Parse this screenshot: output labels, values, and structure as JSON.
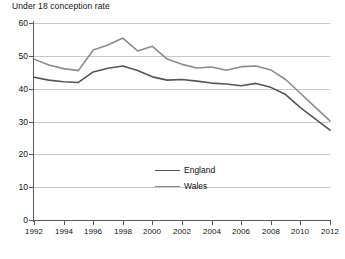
{
  "chart_data": {
    "type": "line",
    "title": "Under 18 conception rate",
    "xlabel": "",
    "ylabel": "",
    "grid": true,
    "legend_position": "inside-center",
    "xlim": [
      1992,
      2012
    ],
    "ylim": [
      0,
      60
    ],
    "yticks": [
      0,
      10,
      20,
      30,
      40,
      50,
      60
    ],
    "x": [
      1992,
      1993,
      1994,
      1995,
      1996,
      1997,
      1998,
      1999,
      2000,
      2001,
      2002,
      2003,
      2004,
      2005,
      2006,
      2007,
      2008,
      2009,
      2010,
      2011,
      2012
    ],
    "xticks": [
      1992,
      1994,
      1996,
      1998,
      2000,
      2002,
      2004,
      2006,
      2008,
      2010,
      2012
    ],
    "xtick_labels": [
      "1992",
      "1994",
      "1996",
      "1998",
      "2000",
      "2002",
      "2004",
      "2006",
      "2008",
      "2010",
      "2012"
    ],
    "ytick_labels": [
      "0",
      "10",
      "20",
      "30",
      "40",
      "50",
      "60"
    ],
    "series": [
      {
        "name": "England",
        "color": "#555555",
        "values": [
          43.5,
          42.6,
          42.1,
          41.9,
          45.1,
          46.2,
          46.9,
          45.5,
          43.6,
          42.6,
          42.8,
          42.3,
          41.7,
          41.4,
          40.9,
          41.6,
          40.4,
          38.2,
          34.2,
          30.8,
          27.4
        ]
      },
      {
        "name": "Wales",
        "color": "#8c8c8c",
        "values": [
          49.0,
          47.2,
          46.1,
          45.5,
          51.8,
          53.3,
          55.4,
          51.5,
          52.9,
          49.0,
          47.4,
          46.3,
          46.6,
          45.6,
          46.7,
          46.9,
          45.7,
          42.8,
          38.6,
          34.4,
          30.2
        ]
      }
    ]
  }
}
